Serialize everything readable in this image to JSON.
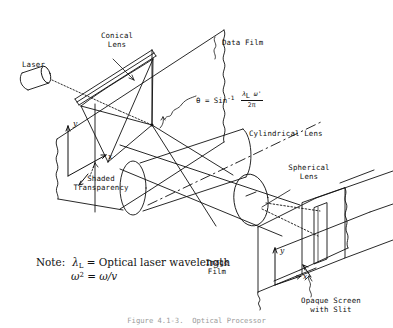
{
  "figure": {
    "background_color": "#ffffff",
    "ink_color": "#111111",
    "caption": "Figure 4.1-3.  Optical Processor"
  },
  "labels": {
    "laser": "Laser",
    "conical_lens": "Conical\nLens",
    "data_film": "Data Film",
    "shaded_transparency": "Shaded\nTransparency",
    "cylindrical_lens": "Cylindrical Lens",
    "spherical_lens": "Spherical\nLens",
    "image_film": "Image\nFilm",
    "opaque_screen": "Opaque Screen\nwith Slit"
  },
  "axes": {
    "left_plane": {
      "y": "y",
      "x": "x"
    },
    "image_plane": {
      "y": "y",
      "x": "x"
    }
  },
  "equation": {
    "theta_symbol": "θ",
    "equals": "=",
    "function": "Sin",
    "exponent": "-1",
    "numerator": "λ",
    "numerator_sub": "L",
    "numerator_second": "ω'",
    "denominator": "2π",
    "full_text": "θ = Sin-1 λL ω' / 2π"
  },
  "note": {
    "prefix": "Note:",
    "line1": {
      "symbol": "λ",
      "symbol_sub": "L",
      "equals": "=",
      "text": "Optical laser wavelength"
    },
    "line2": {
      "symbol": "ω",
      "symbol_sup": "2",
      "equals": "=",
      "text": "ω/v"
    }
  },
  "components": [
    {
      "name": "laser",
      "type": "cylinder-source"
    },
    {
      "name": "conical-lens",
      "type": "lens"
    },
    {
      "name": "shaded-transparency",
      "type": "plane"
    },
    {
      "name": "data-film",
      "type": "film-plane"
    },
    {
      "name": "cylindrical-lens",
      "type": "cylinder"
    },
    {
      "name": "spherical-lens",
      "type": "ellipse-lens"
    },
    {
      "name": "opaque-screen-with-slit",
      "type": "screen"
    },
    {
      "name": "image-film",
      "type": "film-plane"
    }
  ]
}
